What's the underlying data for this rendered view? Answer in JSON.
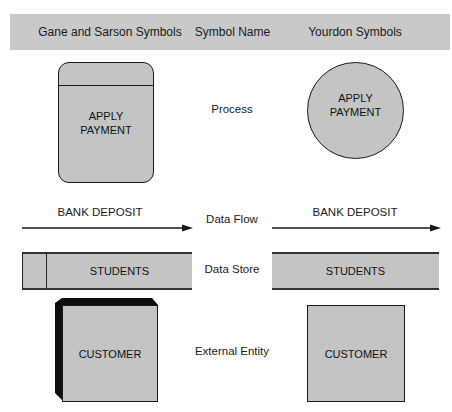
{
  "header": {
    "col_gane_sarson": "Gane and Sarson Symbols",
    "col_symbol_name": "Symbol Name",
    "col_yourdon": "Yourdon Symbols",
    "band_color": "#c9c9c9"
  },
  "rows": {
    "process": {
      "name": "Process",
      "gane_sarson_text_line1": "APPLY",
      "gane_sarson_text_line2": "PAYMENT",
      "yourdon_text_line1": "APPLY",
      "yourdon_text_line2": "PAYMENT"
    },
    "data_flow": {
      "name": "Data Flow",
      "gane_sarson_label": "BANK DEPOSIT",
      "yourdon_label": "BANK DEPOSIT"
    },
    "data_store": {
      "name": "Data Store",
      "gane_sarson_label": "STUDENTS",
      "yourdon_label": "STUDENTS"
    },
    "external_entity": {
      "name": "External Entity",
      "gane_sarson_label": "CUSTOMER",
      "yourdon_label": "CUSTOMER"
    }
  },
  "colors": {
    "shape_fill": "#c4c4c4",
    "stroke": "#1a1a1a"
  }
}
